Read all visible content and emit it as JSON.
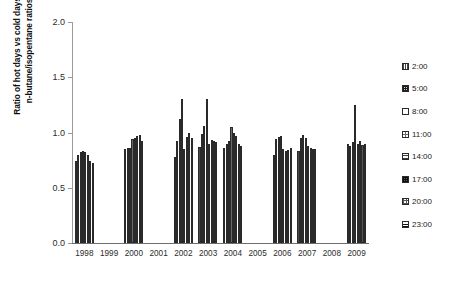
{
  "chart_data": {
    "type": "bar",
    "title": "",
    "xlabel": "",
    "ylabel": "Ratio of hot days vs cold days of\nn-butane/isopentane ratios",
    "ylim": [
      0.0,
      2.0
    ],
    "ytick_labels": [
      "0.0",
      "0.5",
      "1.0",
      "1.5",
      "2.0"
    ],
    "ytick_values": [
      0.0,
      0.5,
      1.0,
      1.5,
      2.0
    ],
    "grid": false,
    "legend_position": "right",
    "categories": [
      "1998",
      "1999",
      "2000",
      "2001",
      "2002",
      "2003",
      "2004",
      "2005",
      "2006",
      "2007",
      "2008",
      "2009"
    ],
    "series": [
      {
        "name": "2:00",
        "values": [
          0.74,
          null,
          0.85,
          null,
          0.78,
          0.87,
          0.86,
          null,
          0.8,
          0.83,
          null,
          0.9
        ]
      },
      {
        "name": "5:00",
        "values": [
          0.8,
          null,
          0.86,
          null,
          0.92,
          0.99,
          0.9,
          null,
          0.94,
          0.95,
          null,
          0.88
        ]
      },
      {
        "name": "8:00",
        "values": [
          0.82,
          null,
          0.86,
          null,
          1.12,
          1.06,
          0.92,
          null,
          0.96,
          0.98,
          null,
          0.91
        ]
      },
      {
        "name": "11:00",
        "values": [
          0.83,
          null,
          0.94,
          null,
          1.3,
          1.3,
          1.05,
          null,
          0.97,
          0.95,
          null,
          1.25
        ]
      },
      {
        "name": "14:00",
        "values": [
          0.82,
          null,
          0.95,
          null,
          0.85,
          0.9,
          1.0,
          null,
          0.85,
          0.88,
          null,
          0.9
        ]
      },
      {
        "name": "17:00",
        "values": [
          0.8,
          null,
          0.97,
          null,
          0.96,
          0.93,
          0.97,
          null,
          0.83,
          0.86,
          null,
          0.92
        ]
      },
      {
        "name": "20:00",
        "values": [
          0.74,
          null,
          0.98,
          null,
          1.0,
          0.92,
          0.9,
          null,
          0.84,
          0.85,
          null,
          0.89
        ]
      },
      {
        "name": "23:00",
        "values": [
          0.72,
          null,
          0.92,
          null,
          0.95,
          0.91,
          0.88,
          null,
          0.86,
          0.85,
          null,
          0.9
        ]
      }
    ]
  },
  "legend": {
    "items": [
      {
        "label": "2:00"
      },
      {
        "label": "5:00"
      },
      {
        "label": "8:00"
      },
      {
        "label": "11:00"
      },
      {
        "label": "14:00"
      },
      {
        "label": "17:00"
      },
      {
        "label": "20:00"
      },
      {
        "label": "23:00"
      }
    ]
  }
}
